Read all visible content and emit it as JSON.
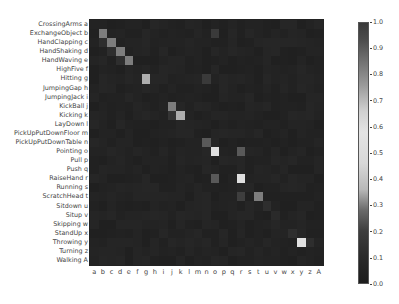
{
  "chart_data": {
    "type": "heatmap",
    "title": "",
    "xlabel": "",
    "ylabel": "",
    "row_labels": [
      "CrossingArms a",
      "ExchangeObject b",
      "HandClapping c",
      "HandShaking d",
      "HandWaving e",
      "HighFive f",
      "Hitting g",
      "JumpingGap h",
      "JumpingJack i",
      "KickBall j",
      "Kicking k",
      "LayDown l",
      "PickUpPutDownFloor m",
      "PickUpPutDownTable n",
      "Pointing o",
      "Pull p",
      "Push q",
      "RaiseHand r",
      "Running s",
      "ScratchHead t",
      "Sitdown u",
      "Situp v",
      "Skipping w",
      "StandUp x",
      "Throwing y",
      "Turning z",
      "Walking A"
    ],
    "col_labels": [
      "a",
      "b",
      "c",
      "d",
      "e",
      "f",
      "g",
      "h",
      "i",
      "j",
      "k",
      "l",
      "m",
      "n",
      "o",
      "p",
      "q",
      "r",
      "s",
      "t",
      "u",
      "v",
      "w",
      "x",
      "y",
      "z",
      "A"
    ],
    "colorbar": {
      "min": 0.0,
      "max": 1.0,
      "ticks": [
        "1.0",
        "0.9",
        "0.8",
        "0.7",
        "0.6",
        "0.5",
        "0.4",
        "0.3",
        "0.2",
        "0.1",
        "0.0"
      ]
    },
    "base_value": 0.05,
    "highlighted_cells": [
      {
        "row": 1,
        "col": 1,
        "value": 0.3
      },
      {
        "row": 2,
        "col": 2,
        "value": 0.3
      },
      {
        "row": 3,
        "col": 3,
        "value": 0.3
      },
      {
        "row": 4,
        "col": 4,
        "value": 0.3
      },
      {
        "row": 6,
        "col": 6,
        "value": 0.35
      },
      {
        "row": 9,
        "col": 9,
        "value": 0.3
      },
      {
        "row": 10,
        "col": 10,
        "value": 0.35
      },
      {
        "row": 13,
        "col": 13,
        "value": 0.25
      },
      {
        "row": 14,
        "col": 14,
        "value": 0.6
      },
      {
        "row": 14,
        "col": 17,
        "value": 0.25
      },
      {
        "row": 17,
        "col": 14,
        "value": 0.25
      },
      {
        "row": 17,
        "col": 17,
        "value": 0.6
      },
      {
        "row": 19,
        "col": 17,
        "value": 0.2
      },
      {
        "row": 19,
        "col": 19,
        "value": 0.3
      },
      {
        "row": 24,
        "col": 24,
        "value": 0.55
      },
      {
        "row": 1,
        "col": 14,
        "value": 0.18
      },
      {
        "row": 6,
        "col": 13,
        "value": 0.18
      },
      {
        "row": 2,
        "col": 1,
        "value": 0.12
      },
      {
        "row": 3,
        "col": 2,
        "value": 0.12
      },
      {
        "row": 4,
        "col": 3,
        "value": 0.12
      },
      {
        "row": 10,
        "col": 9,
        "value": 0.15
      },
      {
        "row": 20,
        "col": 20,
        "value": 0.12
      },
      {
        "row": 21,
        "col": 21,
        "value": 0.1
      },
      {
        "row": 23,
        "col": 23,
        "value": 0.12
      },
      {
        "row": 24,
        "col": 25,
        "value": 0.12
      }
    ]
  }
}
